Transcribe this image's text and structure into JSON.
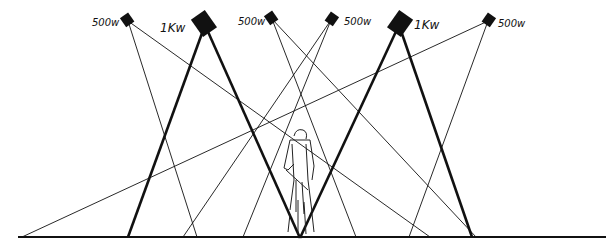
{
  "diagram": {
    "colors": {
      "ink": "#111111",
      "background": "#ffffff"
    },
    "floor": {
      "x1": 18,
      "x2": 606,
      "y": 237
    },
    "lamps": [
      {
        "id": "lamp-1",
        "label": "500w",
        "x": 128,
        "y": 21,
        "size": "small",
        "label_x": 92,
        "label_y": 26,
        "beams": [
          {
            "x": 197,
            "y": 237,
            "weight": "thin"
          },
          {
            "x": 430,
            "y": 237,
            "weight": "thin"
          }
        ]
      },
      {
        "id": "lamp-2",
        "label": "1Kw",
        "x": 205,
        "y": 25,
        "size": "large",
        "label_x": 160,
        "label_y": 32,
        "beams": [
          {
            "x": 128,
            "y": 237,
            "weight": "thick"
          },
          {
            "x": 300,
            "y": 238,
            "weight": "thick"
          }
        ]
      },
      {
        "id": "lamp-3",
        "label": "500w",
        "x": 272,
        "y": 19,
        "size": "small",
        "label_x": 238,
        "label_y": 25,
        "beams": [
          {
            "x": 356,
            "y": 237,
            "weight": "thin"
          },
          {
            "x": 476,
            "y": 237,
            "weight": "thin"
          }
        ]
      },
      {
        "id": "lamp-4",
        "label": "500w",
        "x": 331,
        "y": 20,
        "size": "small",
        "label_x": 344,
        "label_y": 25,
        "beams": [
          {
            "x": 183,
            "y": 237,
            "weight": "thin"
          },
          {
            "x": 243,
            "y": 237,
            "weight": "thin"
          }
        ]
      },
      {
        "id": "lamp-5",
        "label": "1Kw",
        "x": 399,
        "y": 25,
        "size": "large",
        "label_x": 414,
        "label_y": 29,
        "beams": [
          {
            "x": 300,
            "y": 238,
            "weight": "thick"
          },
          {
            "x": 472,
            "y": 237,
            "weight": "thick"
          }
        ]
      },
      {
        "id": "lamp-6",
        "label": "500w",
        "x": 488,
        "y": 21,
        "size": "small",
        "label_x": 498,
        "label_y": 27,
        "beams": [
          {
            "x": 22,
            "y": 237,
            "weight": "thin"
          },
          {
            "x": 409,
            "y": 237,
            "weight": "thin"
          }
        ]
      }
    ],
    "figure": {
      "label": "performer",
      "x": 300,
      "y": 140
    }
  }
}
